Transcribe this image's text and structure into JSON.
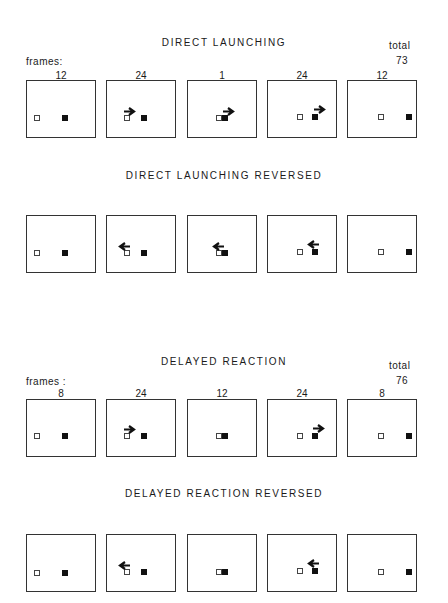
{
  "sections": [
    {
      "id": "direct-launching",
      "title": "DIRECT LAUNCHING",
      "title_y": 37,
      "show_frames": true,
      "frames_label": "frames:",
      "total_label": "total",
      "total_value": "73",
      "frames_label_y": 56,
      "total_label_y": 40,
      "total_value_y": 55,
      "counts_y": 70,
      "box_top": 80,
      "panels": [
        {
          "count": "12",
          "open_x": 7,
          "filled_x": 35,
          "sq_y": 34,
          "arrow": null
        },
        {
          "count": "24",
          "open_x": 17,
          "filled_x": 34,
          "sq_y": 34,
          "arrow": {
            "dir": "right",
            "x": 16,
            "y": 21
          }
        },
        {
          "count": "1",
          "open_x": 28,
          "filled_x": 34,
          "sq_y": 34,
          "arrow": {
            "dir": "right",
            "x": 34,
            "y": 21
          }
        },
        {
          "count": "24",
          "open_x": 29,
          "filled_x": 44,
          "sq_y": 33,
          "arrow": {
            "dir": "right",
            "x": 45,
            "y": 19
          }
        },
        {
          "count": "12",
          "open_x": 30,
          "filled_x": 58,
          "sq_y": 33,
          "arrow": null
        }
      ]
    },
    {
      "id": "direct-launching-reversed",
      "title": "DIRECT LAUNCHING REVERSED",
      "title_y": 170,
      "show_frames": false,
      "box_top": 215,
      "panels": [
        {
          "count": "",
          "open_x": 7,
          "filled_x": 35,
          "sq_y": 34,
          "arrow": null
        },
        {
          "count": "",
          "open_x": 17,
          "filled_x": 34,
          "sq_y": 34,
          "arrow": {
            "dir": "left",
            "x": 11,
            "y": 21
          }
        },
        {
          "count": "",
          "open_x": 28,
          "filled_x": 34,
          "sq_y": 34,
          "arrow": {
            "dir": "left",
            "x": 24,
            "y": 21
          }
        },
        {
          "count": "",
          "open_x": 29,
          "filled_x": 44,
          "sq_y": 33,
          "arrow": {
            "dir": "left",
            "x": 39,
            "y": 19
          }
        },
        {
          "count": "",
          "open_x": 30,
          "filled_x": 58,
          "sq_y": 33,
          "arrow": null
        }
      ]
    },
    {
      "id": "delayed-reaction",
      "title": "DELAYED REACTION",
      "title_y": 356,
      "show_frames": true,
      "frames_label": "frames :",
      "total_label": "total",
      "total_value": "76",
      "frames_label_y": 376,
      "total_label_y": 360,
      "total_value_y": 375,
      "counts_y": 388,
      "box_top": 399,
      "panels": [
        {
          "count": "8",
          "open_x": 7,
          "filled_x": 35,
          "sq_y": 33,
          "arrow": null
        },
        {
          "count": "24",
          "open_x": 17,
          "filled_x": 34,
          "sq_y": 33,
          "arrow": {
            "dir": "right",
            "x": 16,
            "y": 20
          }
        },
        {
          "count": "12",
          "open_x": 28,
          "filled_x": 34,
          "sq_y": 33,
          "arrow": null
        },
        {
          "count": "24",
          "open_x": 29,
          "filled_x": 44,
          "sq_y": 33,
          "arrow": {
            "dir": "right",
            "x": 44,
            "y": 19
          }
        },
        {
          "count": "8",
          "open_x": 30,
          "filled_x": 58,
          "sq_y": 33,
          "arrow": null
        }
      ]
    },
    {
      "id": "delayed-reaction-reversed",
      "title": "DELAYED REACTION REVERSED",
      "title_y": 488,
      "show_frames": false,
      "box_top": 534,
      "panels": [
        {
          "count": "",
          "open_x": 7,
          "filled_x": 35,
          "sq_y": 35,
          "arrow": null
        },
        {
          "count": "",
          "open_x": 17,
          "filled_x": 34,
          "sq_y": 34,
          "arrow": {
            "dir": "left",
            "x": 11,
            "y": 21
          }
        },
        {
          "count": "",
          "open_x": 28,
          "filled_x": 34,
          "sq_y": 34,
          "arrow": null
        },
        {
          "count": "",
          "open_x": 29,
          "filled_x": 44,
          "sq_y": 33,
          "arrow": {
            "dir": "left",
            "x": 39,
            "y": 19
          }
        },
        {
          "count": "",
          "open_x": 30,
          "filled_x": 58,
          "sq_y": 34,
          "arrow": null
        }
      ]
    }
  ],
  "panel_lefts": [
    26,
    106,
    187,
    267,
    347
  ]
}
